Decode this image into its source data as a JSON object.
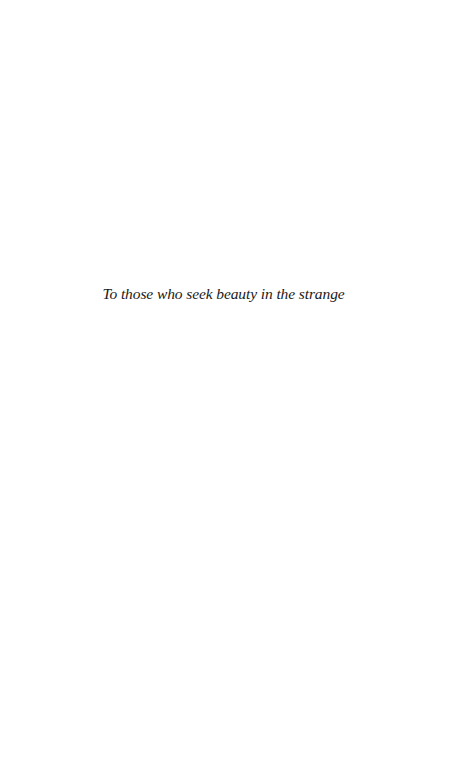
{
  "page": {
    "dedication": "To those who seek beauty in the strange"
  },
  "colors": {
    "background": "#ffffff",
    "text": "#1a1a1a"
  }
}
